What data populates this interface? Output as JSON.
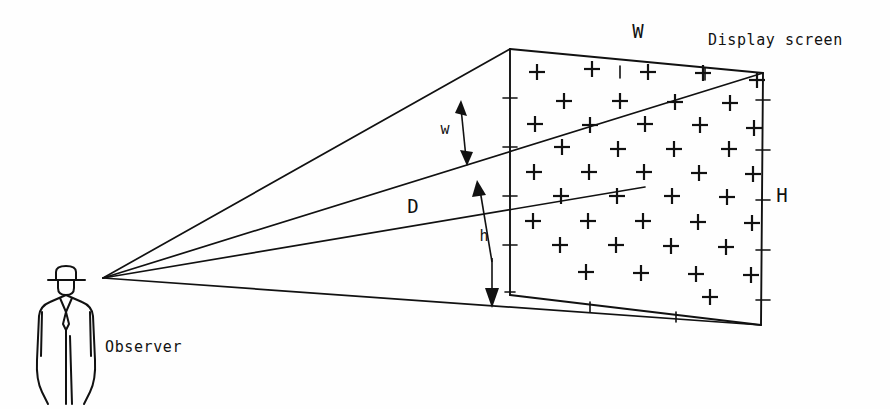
{
  "figure": {
    "background_color": "#fefefe",
    "ink_color": "#111111"
  },
  "labels": {
    "display_screen": "Display screen",
    "observer": "Observer",
    "screen_width": "W",
    "screen_height": "H",
    "subtended_width": "w",
    "subtended_height": "h",
    "viewing_distance": "D"
  },
  "geometry": {
    "eye_point": {
      "x": 103,
      "y": 278
    },
    "screen_corners": {
      "top_left": {
        "x": 510,
        "y": 49
      },
      "top_right": {
        "x": 763,
        "y": 73
      },
      "bottom_right": {
        "x": 761,
        "y": 325
      },
      "bottom_left": {
        "x": 510,
        "y": 295
      }
    },
    "sight_lines": [
      {
        "name": "upper-bound-line",
        "to": {
          "x": 510,
          "y": 49
        }
      },
      {
        "name": "w-upper-line",
        "to": {
          "x": 763,
          "y": 73
        }
      },
      {
        "name": "d-axis-line",
        "to": {
          "x": 645,
          "y": 187
        }
      },
      {
        "name": "lower-bound-line",
        "to": {
          "x": 761,
          "y": 325
        }
      }
    ],
    "left_edge_ticks": [
      {
        "y": 98
      },
      {
        "y": 147
      },
      {
        "y": 196
      },
      {
        "y": 245
      },
      {
        "y": 292
      }
    ],
    "right_edge_ticks": [
      {
        "y": 100
      },
      {
        "y": 150
      },
      {
        "y": 200
      },
      {
        "y": 250
      },
      {
        "y": 300
      }
    ]
  },
  "chart_data": {
    "type": "diagram",
    "plus_grid": {
      "description": "Staggered grid of plus marks filling the display screen quadrilateral",
      "rows": 9,
      "pattern": "alternating 5 and 4 marks per row, offset by half a column",
      "marks": [
        {
          "x": 537,
          "y": 72
        },
        {
          "x": 592,
          "y": 69
        },
        {
          "x": 648,
          "y": 72
        },
        {
          "x": 703,
          "y": 73
        },
        {
          "x": 757,
          "y": 80
        },
        {
          "x": 564,
          "y": 101
        },
        {
          "x": 620,
          "y": 101
        },
        {
          "x": 675,
          "y": 102
        },
        {
          "x": 730,
          "y": 103
        },
        {
          "x": 535,
          "y": 124
        },
        {
          "x": 590,
          "y": 125
        },
        {
          "x": 645,
          "y": 124
        },
        {
          "x": 700,
          "y": 125
        },
        {
          "x": 754,
          "y": 128
        },
        {
          "x": 562,
          "y": 147
        },
        {
          "x": 618,
          "y": 149
        },
        {
          "x": 674,
          "y": 149
        },
        {
          "x": 729,
          "y": 149
        },
        {
          "x": 534,
          "y": 172
        },
        {
          "x": 589,
          "y": 172
        },
        {
          "x": 644,
          "y": 172
        },
        {
          "x": 699,
          "y": 173
        },
        {
          "x": 753,
          "y": 174
        },
        {
          "x": 561,
          "y": 196
        },
        {
          "x": 617,
          "y": 196
        },
        {
          "x": 672,
          "y": 196
        },
        {
          "x": 727,
          "y": 197
        },
        {
          "x": 533,
          "y": 221
        },
        {
          "x": 588,
          "y": 221
        },
        {
          "x": 643,
          "y": 221
        },
        {
          "x": 698,
          "y": 222
        },
        {
          "x": 752,
          "y": 223
        },
        {
          "x": 560,
          "y": 245
        },
        {
          "x": 616,
          "y": 245
        },
        {
          "x": 671,
          "y": 246
        },
        {
          "x": 726,
          "y": 247
        },
        {
          "x": 586,
          "y": 272
        },
        {
          "x": 641,
          "y": 273
        },
        {
          "x": 696,
          "y": 274
        },
        {
          "x": 751,
          "y": 275
        },
        {
          "x": 710,
          "y": 297
        }
      ]
    },
    "label_positions": [
      {
        "text": "W",
        "x": 638,
        "y": 32,
        "size": "cap"
      },
      {
        "text": "Display screen",
        "x": 708,
        "y": 40,
        "size": "word"
      },
      {
        "text": "H",
        "x": 782,
        "y": 196,
        "size": "cap"
      },
      {
        "text": "w",
        "x": 445,
        "y": 129,
        "size": "small"
      },
      {
        "text": "D",
        "x": 413,
        "y": 207,
        "size": "cap"
      },
      {
        "text": "h",
        "x": 484,
        "y": 236,
        "size": "small"
      },
      {
        "text": "Observer",
        "x": 105,
        "y": 347,
        "size": "word"
      }
    ],
    "dimension_arrows": [
      {
        "name": "w-arrow",
        "from": {
          "x": 460,
          "y": 102
        },
        "to": {
          "x": 466,
          "y": 162
        },
        "double_headed": true
      },
      {
        "name": "h-arrow",
        "from": {
          "x": 492,
          "y": 185
        },
        "to": {
          "x": 492,
          "y": 305
        },
        "double_headed": true
      }
    ]
  }
}
